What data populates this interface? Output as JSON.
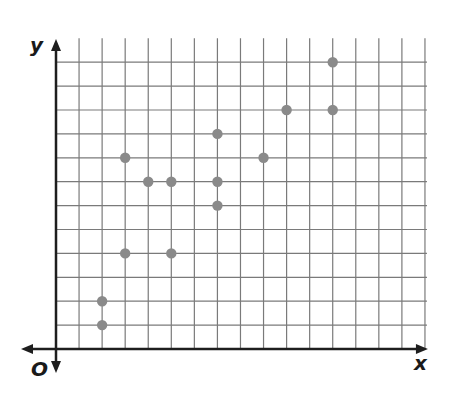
{
  "chart_data": {
    "type": "scatter",
    "title": "",
    "xlabel": "x",
    "ylabel": "y",
    "origin_label": "O",
    "xlim": [
      0,
      16
    ],
    "ylim": [
      0,
      12
    ],
    "grid": true,
    "tick_labels": false,
    "legend": null,
    "points": [
      {
        "x": 2,
        "y": 1
      },
      {
        "x": 2,
        "y": 2
      },
      {
        "x": 3,
        "y": 4
      },
      {
        "x": 3,
        "y": 8
      },
      {
        "x": 4,
        "y": 7
      },
      {
        "x": 5,
        "y": 7
      },
      {
        "x": 5,
        "y": 4
      },
      {
        "x": 7,
        "y": 9
      },
      {
        "x": 7,
        "y": 7
      },
      {
        "x": 7,
        "y": 6
      },
      {
        "x": 9,
        "y": 8
      },
      {
        "x": 10,
        "y": 10
      },
      {
        "x": 12,
        "y": 10
      },
      {
        "x": 12,
        "y": 12
      }
    ]
  },
  "colors": {
    "grid": "#7a7a7a",
    "axis": "#1e1e1e",
    "point": "#8a8a8a"
  }
}
